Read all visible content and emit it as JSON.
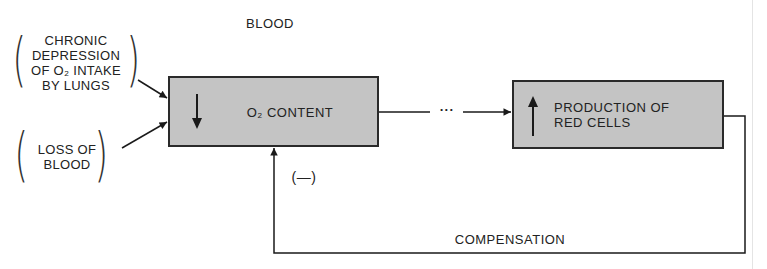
{
  "diagram": {
    "header": "BLOOD",
    "causes": [
      {
        "lines": [
          "CHRONIC",
          "DEPRESSION",
          "OF O₂ INTAKE",
          "BY LUNGS"
        ]
      },
      {
        "lines": [
          "LOSS OF",
          "BLOOD"
        ]
      }
    ],
    "boxes": {
      "oxygen_content": {
        "arrow": "down",
        "label": "O₂ CONTENT"
      },
      "red_cell_production": {
        "arrow": "up",
        "label_line1": "PRODUCTION OF",
        "label_line2": "RED CELLS"
      }
    },
    "connector_dots": "···",
    "feedback_sign": "(—)",
    "feedback_label": "COMPENSATION",
    "colors": {
      "box_fill": "#c4c4c4",
      "line": "#2a2a2a",
      "background": "#ffffff"
    }
  }
}
